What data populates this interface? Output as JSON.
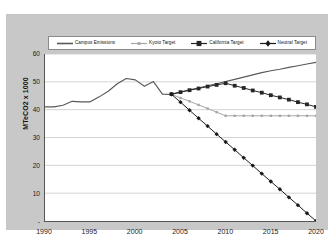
{
  "chart_data": {
    "type": "line",
    "title": "",
    "xlabel": "",
    "ylabel": "MTeCO2 x 1000",
    "xlim": [
      1990,
      2020
    ],
    "ylim": [
      0,
      60
    ],
    "grid": true,
    "legend_position": "top",
    "x_ticks": [
      "1990",
      "1995",
      "2000",
      "2005",
      "2010",
      "2015",
      "2020"
    ],
    "y_ticks": [
      "-",
      "10",
      "20",
      "30",
      "40",
      "50",
      "60"
    ],
    "series": [
      {
        "name": "Campus Emissions",
        "color": "#595959",
        "marker": "none",
        "x": [
          1990,
          1991,
          1992,
          1993,
          1994,
          1995,
          1996,
          1997,
          1998,
          1999,
          2000,
          2001,
          2002,
          2003,
          2004,
          2005,
          2006,
          2007,
          2008,
          2009,
          2010,
          2011,
          2012,
          2013,
          2014,
          2015,
          2016,
          2017,
          2018,
          2019,
          2020
        ],
        "values": [
          41.0,
          41.0,
          41.6,
          43.0,
          42.8,
          42.8,
          44.6,
          46.6,
          49.3,
          51.2,
          50.7,
          48.4,
          50.1,
          45.6,
          45.5,
          46.3,
          47.1,
          47.8,
          48.6,
          49.3,
          50.1,
          50.9,
          51.7,
          52.5,
          53.3,
          54.0,
          54.5,
          55.2,
          55.8,
          56.4,
          57.0
        ]
      },
      {
        "name": "Kyoto Target",
        "color": "#a6a6a6",
        "marker": "small-square",
        "x": [
          2004,
          2005,
          2006,
          2007,
          2008,
          2009,
          2010,
          2011,
          2012,
          2013,
          2014,
          2015,
          2016,
          2017,
          2018,
          2019,
          2020
        ],
        "values": [
          45.5,
          44.2,
          43.0,
          41.7,
          40.4,
          39.1,
          37.8,
          37.8,
          37.8,
          37.8,
          37.8,
          37.8,
          37.8,
          37.8,
          37.8,
          37.8,
          37.8
        ]
      },
      {
        "name": "California Target",
        "color": "#262626",
        "marker": "square",
        "x": [
          2004,
          2005,
          2006,
          2007,
          2008,
          2009,
          2010,
          2011,
          2012,
          2013,
          2014,
          2015,
          2016,
          2017,
          2018,
          2019,
          2020
        ],
        "values": [
          45.6,
          46.3,
          47.0,
          47.6,
          48.3,
          48.9,
          49.5,
          48.6,
          47.8,
          46.9,
          46.1,
          45.2,
          44.4,
          43.6,
          42.7,
          41.9,
          41.0
        ]
      },
      {
        "name": "Neutral Target",
        "color": "#1a1a1a",
        "marker": "diamond",
        "x": [
          2004,
          2005,
          2006,
          2007,
          2008,
          2009,
          2010,
          2011,
          2012,
          2013,
          2014,
          2015,
          2016,
          2017,
          2018,
          2019,
          2020
        ],
        "values": [
          45.5,
          42.7,
          39.8,
          36.9,
          34.1,
          31.2,
          28.4,
          25.6,
          22.7,
          19.9,
          17.0,
          14.2,
          11.4,
          8.5,
          5.7,
          2.8,
          0.0
        ]
      }
    ]
  },
  "legend": {
    "items": [
      {
        "label": "Campus Emissions",
        "color": "#595959",
        "marker": "none"
      },
      {
        "label": "Kyoto Target",
        "color": "#a6a6a6",
        "marker": "small-square"
      },
      {
        "label": "California Target",
        "color": "#262626",
        "marker": "square"
      },
      {
        "label": "Neutral Target",
        "color": "#1a1a1a",
        "marker": "diamond"
      }
    ]
  },
  "colors": {
    "canvas_background": "#c8c8c8",
    "plot_background": "#ffffff",
    "gridline": "#bfbfbf",
    "axis": "#555555"
  }
}
